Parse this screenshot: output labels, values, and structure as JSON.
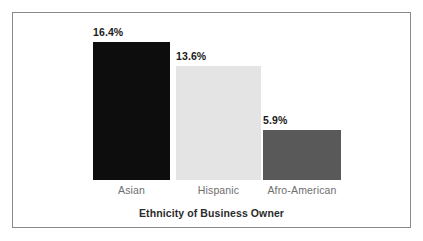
{
  "chart_data": {
    "type": "bar",
    "title": "",
    "subtitle": "",
    "xlabel": "Ethnicity of Business Owner",
    "ylabel": "",
    "categories": [
      "Asian",
      "Hispanic",
      "Afro-American"
    ],
    "values": [
      16.4,
      13.6,
      5.9
    ],
    "value_labels": [
      "16.4%",
      "13.6%",
      "5.9%"
    ],
    "value_unit": "%",
    "ylim": [
      0,
      16.4
    ],
    "grid": false,
    "legend": "none",
    "bar_colors": [
      "#0d0d0d",
      "#e4e4e4",
      "#595959"
    ],
    "series": [
      {
        "name": "Percent of business owners",
        "values": [
          16.4,
          13.6,
          5.9
        ]
      }
    ],
    "annotations": []
  },
  "figure": {
    "frame_color": "#8a8a8a",
    "background_color": "#ffffff",
    "label_color": "#6e6e6e",
    "value_color": "#1a1a1a",
    "axis_title_color": "#2b2b2b"
  }
}
